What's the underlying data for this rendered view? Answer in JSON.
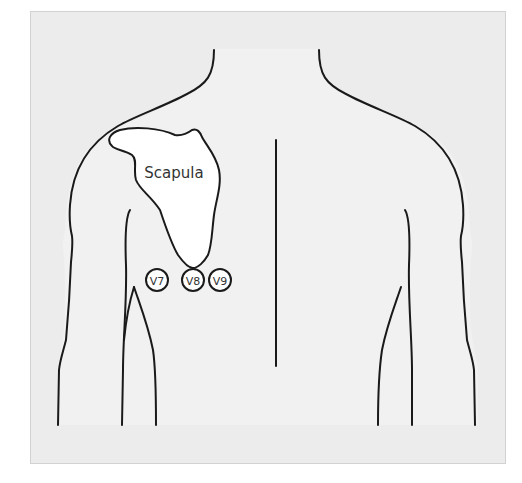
{
  "diagram": {
    "labels": {
      "scapula": "Scapula"
    },
    "electrodes": [
      {
        "id": "v7",
        "label": "V7"
      },
      {
        "id": "v8",
        "label": "V8"
      },
      {
        "id": "v9",
        "label": "V9"
      }
    ],
    "colors": {
      "panel_background": "#ececec",
      "body_fill": "#f1f1f1",
      "scapula_fill": "#ffffff",
      "outline": "#1a1a1a",
      "label_text": "#333333"
    }
  }
}
